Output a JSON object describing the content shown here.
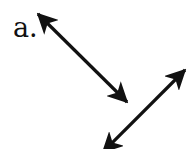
{
  "figure": {
    "label": "a.",
    "stroke_color": "#111111",
    "background": "#ffffff"
  },
  "lines": [
    {
      "name": "line-1",
      "start": [
        38,
        14
      ],
      "end": [
        127,
        102
      ],
      "arrowheads": "both"
    },
    {
      "name": "line-2",
      "start": [
        185,
        70
      ],
      "end": [
        103,
        152
      ],
      "arrowheads": "both"
    }
  ]
}
